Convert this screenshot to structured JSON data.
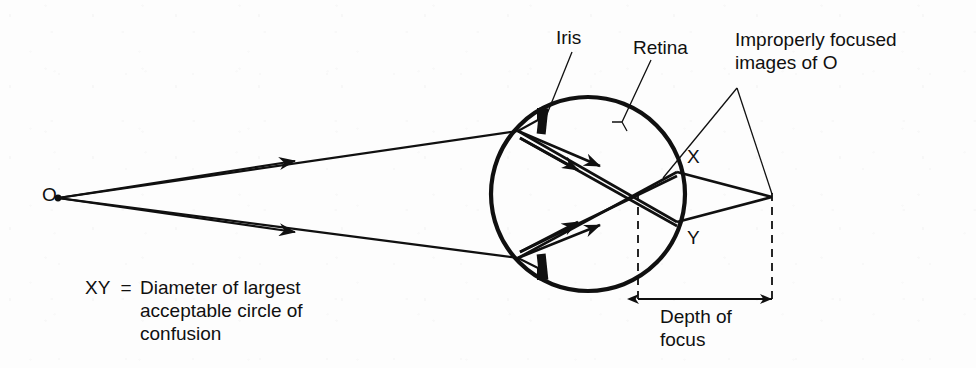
{
  "figure": {
    "type": "optics-ray-diagram",
    "background_color": "#fdfdfd",
    "ink_color": "#101010"
  },
  "labels": {
    "iris": "Iris",
    "retina": "Retina",
    "improperly_focused": "Improperly focused\nimages of O",
    "point_x": "X",
    "point_y": "Y",
    "object_point": "O",
    "depth_of_focus": "Depth of\nfocus"
  },
  "caption": {
    "symbol": "XY  =",
    "definition": "Diameter of largest\nacceptable circle of\nconfusion"
  },
  "geometry": {
    "object_point": {
      "x": 58,
      "y": 198
    },
    "eyeball": {
      "cx": 588,
      "cy": 194,
      "r": 97
    },
    "cornea_entry_top": {
      "x": 518,
      "y": 131
    },
    "cornea_entry_bottom": {
      "x": 518,
      "y": 258
    },
    "retina_point_x": {
      "x": 677,
      "y": 172
    },
    "retina_point_y": {
      "x": 677,
      "y": 222
    },
    "convergence_point": {
      "x": 772,
      "y": 197
    },
    "depth_of_focus_left": 638,
    "depth_of_focus_right": 772,
    "dimension_arrow_y": 299
  }
}
